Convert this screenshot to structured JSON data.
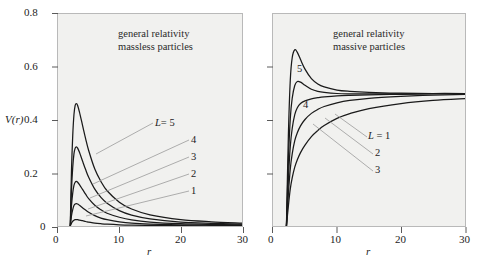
{
  "figure": {
    "background": "#ffffff",
    "panel_background": "#f1f1ef",
    "panel_border": "#b9b9b9",
    "curve_color": "#1a1a1a",
    "leader_color": "#9a9a9a"
  },
  "chart_data": [
    {
      "type": "line",
      "id": "left-panel",
      "title": "general relativity\nmassless particles",
      "title_line1": "general relativity",
      "title_line2": "massless particles",
      "xlabel": "r",
      "ylabel": "V(r)",
      "xlim": [
        0,
        30
      ],
      "ylim": [
        0,
        0.8
      ],
      "xticks": [
        0,
        10,
        20,
        30
      ],
      "xticklabels": [
        "0",
        "10",
        "20",
        "30"
      ],
      "yticks": [
        0,
        0.2,
        0.4,
        0.6,
        0.8
      ],
      "yticklabels": [
        "0",
        "0.2",
        "0.4",
        "0.6",
        "0.8"
      ],
      "grid": false,
      "legend_position": "inside-curve-labels",
      "series": [
        {
          "name": "L = 5",
          "label": "L = 5",
          "peak_r": 3.0,
          "peak_V": 0.46,
          "x": [
            2.0,
            2.2,
            2.4,
            2.6,
            2.8,
            3.0,
            3.2,
            3.5,
            4.0,
            4.5,
            5.0,
            6.0,
            7.0,
            8.0,
            10.0,
            12.0,
            15.0,
            20.0,
            25.0,
            30.0
          ],
          "y": [
            0.0,
            0.21,
            0.34,
            0.42,
            0.455,
            0.462,
            0.455,
            0.43,
            0.38,
            0.33,
            0.285,
            0.215,
            0.168,
            0.133,
            0.09,
            0.064,
            0.042,
            0.024,
            0.016,
            0.011
          ]
        },
        {
          "name": "4",
          "label": "4",
          "peak_r": 3.0,
          "peak_V": 0.3,
          "x": [
            2.0,
            2.2,
            2.4,
            2.6,
            2.8,
            3.0,
            3.2,
            3.5,
            4.0,
            4.5,
            5.0,
            6.0,
            7.0,
            8.0,
            10.0,
            12.0,
            15.0,
            20.0,
            25.0,
            30.0
          ],
          "y": [
            0.0,
            0.137,
            0.221,
            0.272,
            0.294,
            0.299,
            0.294,
            0.278,
            0.245,
            0.213,
            0.184,
            0.139,
            0.108,
            0.086,
            0.058,
            0.041,
            0.027,
            0.015,
            0.01,
            0.007
          ]
        },
        {
          "name": "3",
          "label": "3",
          "peak_r": 3.0,
          "peak_V": 0.17,
          "x": [
            2.0,
            2.2,
            2.4,
            2.6,
            2.8,
            3.0,
            3.2,
            3.5,
            4.0,
            4.5,
            5.0,
            6.0,
            7.0,
            8.0,
            10.0,
            12.0,
            15.0,
            20.0,
            25.0,
            30.0
          ],
          "y": [
            0.0,
            0.077,
            0.124,
            0.153,
            0.165,
            0.168,
            0.165,
            0.156,
            0.138,
            0.12,
            0.103,
            0.078,
            0.061,
            0.048,
            0.033,
            0.023,
            0.015,
            0.0086,
            0.0056,
            0.0039
          ]
        },
        {
          "name": "2",
          "label": "2",
          "peak_r": 3.0,
          "peak_V": 0.085,
          "x": [
            2.0,
            2.2,
            2.4,
            2.6,
            2.8,
            3.0,
            3.2,
            3.5,
            4.0,
            4.5,
            5.0,
            6.0,
            7.0,
            8.0,
            10.0,
            12.0,
            15.0,
            20.0,
            25.0,
            30.0
          ],
          "y": [
            0.0,
            0.039,
            0.062,
            0.077,
            0.083,
            0.084,
            0.083,
            0.078,
            0.069,
            0.06,
            0.052,
            0.039,
            0.03,
            0.024,
            0.016,
            0.011,
            0.0075,
            0.0043,
            0.0028,
            0.0019
          ]
        },
        {
          "name": "1",
          "label": "1",
          "peak_r": 3.0,
          "peak_V": 0.025,
          "x": [
            2.0,
            2.2,
            2.4,
            2.6,
            2.8,
            3.0,
            3.2,
            3.5,
            4.0,
            4.5,
            5.0,
            6.0,
            7.0,
            8.0,
            10.0,
            12.0,
            15.0,
            20.0,
            25.0,
            30.0
          ],
          "y": [
            0.0,
            0.011,
            0.018,
            0.022,
            0.024,
            0.024,
            0.024,
            0.022,
            0.02,
            0.017,
            0.015,
            0.011,
            0.0086,
            0.0068,
            0.0046,
            0.0033,
            0.0021,
            0.0012,
            0.0008,
            0.0006
          ]
        }
      ]
    },
    {
      "type": "line",
      "id": "right-panel",
      "title": "general relativity\nmassive particles",
      "title_line1": "general relativity",
      "title_line2": "massive particles",
      "xlabel": "r",
      "ylabel": "",
      "xlim": [
        0,
        30
      ],
      "ylim": [
        0,
        0.8
      ],
      "xticks": [
        0,
        10,
        20,
        30
      ],
      "xticklabels": [
        "0",
        "10",
        "20",
        "30"
      ],
      "yticks": [
        0,
        0.2,
        0.4,
        0.6,
        0.8
      ],
      "yticklabels": [
        "",
        "",
        "",
        "",
        ""
      ],
      "asymptote_V": 0.5,
      "grid": false,
      "legend_position": "inside-curve-labels",
      "series": [
        {
          "name": "5",
          "label": "5",
          "peak_r": 3.4,
          "peak_V": 0.665,
          "x": [
            2.1,
            2.4,
            2.7,
            3.0,
            3.4,
            3.8,
            4.3,
            5.0,
            6.0,
            7.0,
            8.0,
            10.0,
            12.0,
            15.0,
            20.0,
            25.0,
            30.0
          ],
          "y": [
            0.0,
            0.34,
            0.55,
            0.635,
            0.665,
            0.655,
            0.628,
            0.592,
            0.556,
            0.536,
            0.525,
            0.513,
            0.508,
            0.504,
            0.501,
            0.5,
            0.5
          ]
        },
        {
          "name": "4",
          "label": "4",
          "peak_r": 3.8,
          "peak_V": 0.545,
          "x": [
            2.1,
            2.4,
            2.7,
            3.0,
            3.4,
            3.8,
            4.3,
            5.0,
            6.0,
            7.0,
            8.0,
            10.0,
            12.0,
            15.0,
            20.0,
            25.0,
            30.0
          ],
          "y": [
            0.0,
            0.245,
            0.405,
            0.482,
            0.53,
            0.545,
            0.543,
            0.531,
            0.516,
            0.508,
            0.504,
            0.5,
            0.499,
            0.499,
            0.499,
            0.5,
            0.5
          ]
        },
        {
          "name": "3",
          "label": "3",
          "peak_r": null,
          "peak_V": 0.5,
          "x": [
            2.1,
            2.4,
            2.7,
            3.0,
            3.4,
            3.8,
            4.3,
            5.0,
            6.0,
            7.0,
            8.0,
            10.0,
            12.0,
            15.0,
            20.0,
            25.0,
            30.0
          ],
          "y": [
            0.0,
            0.175,
            0.3,
            0.368,
            0.42,
            0.446,
            0.462,
            0.472,
            0.48,
            0.484,
            0.487,
            0.491,
            0.493,
            0.495,
            0.497,
            0.499,
            0.5
          ]
        },
        {
          "name": "2",
          "label": "2",
          "peak_r": null,
          "peak_V": 0.5,
          "x": [
            2.1,
            2.4,
            2.7,
            3.0,
            3.4,
            3.8,
            4.3,
            5.0,
            6.0,
            7.0,
            8.0,
            10.0,
            12.0,
            15.0,
            20.0,
            25.0,
            30.0
          ],
          "y": [
            0.0,
            0.12,
            0.215,
            0.272,
            0.322,
            0.352,
            0.378,
            0.402,
            0.425,
            0.44,
            0.451,
            0.465,
            0.474,
            0.482,
            0.489,
            0.494,
            0.497
          ]
        },
        {
          "name": "L = 1",
          "label": "L = 1",
          "peak_r": null,
          "peak_V": 0.5,
          "x": [
            2.1,
            2.4,
            2.7,
            3.0,
            3.4,
            3.8,
            4.3,
            5.0,
            6.0,
            7.0,
            8.0,
            10.0,
            12.0,
            15.0,
            20.0,
            25.0,
            30.0
          ],
          "y": [
            0.0,
            0.075,
            0.14,
            0.182,
            0.222,
            0.25,
            0.277,
            0.305,
            0.337,
            0.36,
            0.379,
            0.406,
            0.424,
            0.443,
            0.462,
            0.474,
            0.481
          ]
        }
      ]
    }
  ],
  "left_panel": {
    "title_line1": "general relativity",
    "title_line2": "massless particles",
    "ylabel": "V(r)",
    "xlabel": "r",
    "yticklabels": [
      "0.8",
      "0.6",
      "0.4",
      "0.2",
      "0"
    ],
    "xticklabels": [
      "0",
      "10",
      "20",
      "30"
    ],
    "curve_labels": [
      "L = 5",
      "4",
      "3",
      "2",
      "1"
    ],
    "curve_label_main": "L",
    "curve_label_eq": "= 5"
  },
  "right_panel": {
    "title_line1": "general relativity",
    "title_line2": "massive particles",
    "xlabel": "r",
    "xticklabels": [
      "0",
      "10",
      "20",
      "30"
    ],
    "curve_label_5": "5",
    "curve_label_4": "4",
    "curve_label_L1": "L = 1",
    "curve_label_2": "2",
    "curve_label_3": "3"
  }
}
